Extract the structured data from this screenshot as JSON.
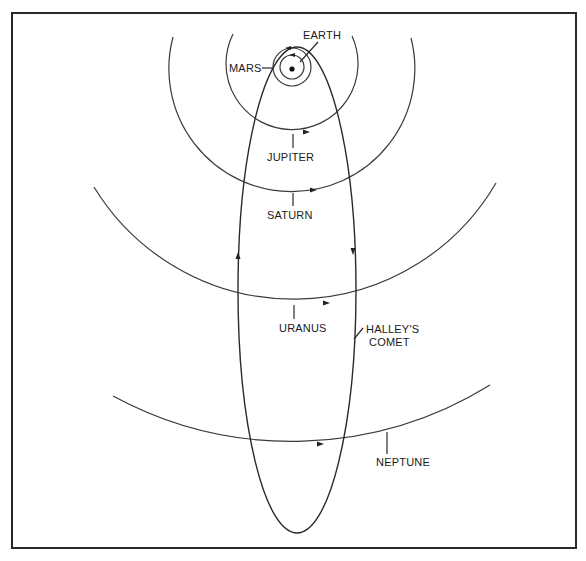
{
  "diagram": {
    "colors": {
      "ink": "#2a2a2a",
      "background": "#ffffff"
    },
    "sun": {
      "name": "sun",
      "cx": 292,
      "cy": 69,
      "r": 2.5
    },
    "orbits": [
      {
        "name": "earth",
        "label": "EARTH",
        "r": 12
      },
      {
        "name": "mars",
        "label": "MARS",
        "r": 20
      },
      {
        "name": "jupiter",
        "label": "JUPITER",
        "r": 66
      },
      {
        "name": "saturn",
        "label": "SATURN",
        "r": 123
      },
      {
        "name": "uranus",
        "label": "URANUS",
        "r": 234
      },
      {
        "name": "neptune",
        "label": "NEPTUNE",
        "r": 376
      }
    ],
    "comet": {
      "label_line1": "HALLEY'S",
      "label_line2": "COMET",
      "cx": 297,
      "cy": 290,
      "rx": 59,
      "ry": 243
    },
    "labels": {
      "earth": "EARTH",
      "mars": "MARS",
      "jupiter": "JUPITER",
      "saturn": "SATURN",
      "uranus": "URANUS",
      "comet_line1": "HALLEY'S",
      "comet_line2": "COMET",
      "neptune": "NEPTUNE"
    }
  }
}
